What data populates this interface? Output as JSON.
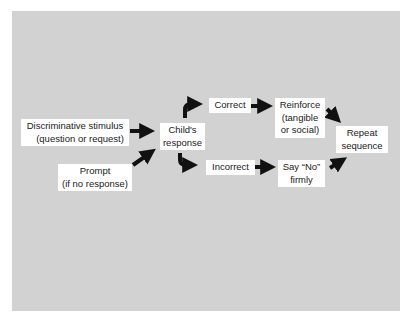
{
  "diagram": {
    "background_color": "#d2d2d2",
    "box_color": "#ffffff",
    "arrow_color": "#111111",
    "nodes": {
      "stimulus": {
        "line1": "Discriminative stimulus",
        "line2": "(question or request)"
      },
      "prompt": {
        "line1": "Prompt",
        "line2": "(if no response)"
      },
      "child_response": {
        "line1": "Child's",
        "line2": "response"
      },
      "correct": {
        "line1": "Correct"
      },
      "incorrect": {
        "line1": "Incorrect"
      },
      "reinforce": {
        "line1": "Reinforce",
        "line2": "(tangible",
        "line3": "or social)"
      },
      "say_no": {
        "line1": "Say “No”",
        "line2": "firmly"
      },
      "repeat": {
        "line1": "Repeat",
        "line2": "sequence"
      }
    },
    "edges": [
      {
        "from": "stimulus",
        "to": "child_response"
      },
      {
        "from": "prompt",
        "to": "child_response"
      },
      {
        "from": "child_response",
        "to": "correct"
      },
      {
        "from": "child_response",
        "to": "incorrect"
      },
      {
        "from": "correct",
        "to": "reinforce"
      },
      {
        "from": "incorrect",
        "to": "say_no"
      },
      {
        "from": "reinforce",
        "to": "repeat"
      },
      {
        "from": "say_no",
        "to": "repeat"
      }
    ]
  }
}
